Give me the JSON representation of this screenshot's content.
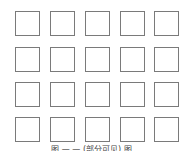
{
  "grid": {
    "rows": 4,
    "cols": 5,
    "cell_style": "empty outlined square",
    "border_color": "#7a7a7a",
    "col_x": [
      15,
      50,
      85,
      120,
      154
    ],
    "row_y": [
      11,
      47,
      82,
      117
    ]
  },
  "caption": {
    "text": "图 — — (部分可见) 图"
  }
}
